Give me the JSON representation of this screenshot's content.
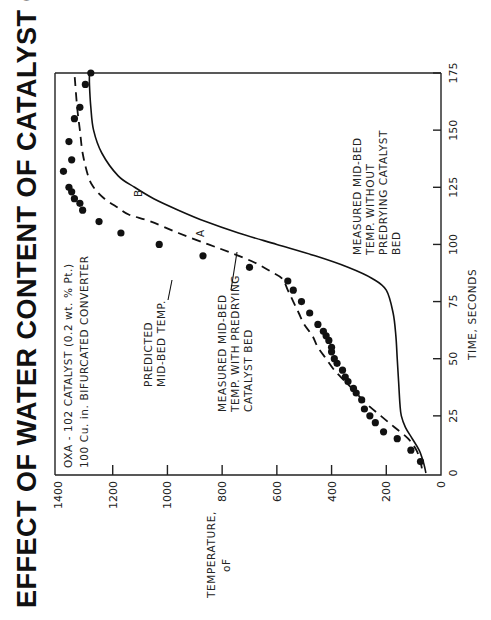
{
  "title": "EFFECT OF WATER CONTENT OF CATALYST ON WARMUP RATE",
  "annotation_box": {
    "line1": "OXA - 102 CATALYST (0.2 wt. % Pt.)",
    "line2": "100 Cu. in. BIFURCATED CONVERTER"
  },
  "labels": {
    "predicted": [
      "PREDICTED",
      "MID-BED TEMP."
    ],
    "measured_with": [
      "MEASURED MID-BED",
      "TEMP. WITH PREDRYING",
      "CATALYST BED"
    ],
    "measured_without": [
      "MEASURED MID-BED",
      "TEMP. WITHOUT",
      "PREDRYING CATALYST",
      "BED"
    ],
    "curve_a": "A",
    "curve_b": "B"
  },
  "axes": {
    "xlabel": "TIME, SECONDS",
    "ylabel_line1": "TEMPERATURE,",
    "ylabel_line2": "oF",
    "x_ticks": [
      "0",
      "25",
      "50",
      "75",
      "100",
      "125",
      "150",
      "175"
    ],
    "y_ticks": [
      "0",
      "200",
      "400",
      "600",
      "800",
      "1000",
      "1200",
      "1400"
    ]
  },
  "chart_data": {
    "type": "line",
    "title": "EFFECT OF WATER CONTENT OF CATALYST ON WARMUP RATE",
    "subtitle": "OXA - 102 CATALYST (0.2 wt. % Pt.) 100 Cu. in. BIFURCATED CONVERTER",
    "xlabel": "TIME, SECONDS",
    "ylabel": "TEMPERATURE, oF",
    "xlim": [
      0,
      175
    ],
    "ylim": [
      0,
      1400
    ],
    "grid": false,
    "legend": "inline annotations",
    "orientation_note": "figure printed rotated 90 degrees counter-clockwise",
    "series": [
      {
        "name": "A - Measured mid-bed temp. with predrying catalyst bed",
        "style": "dashed",
        "x": [
          2,
          5,
          10,
          15,
          20,
          25,
          30,
          35,
          40,
          45,
          50,
          55,
          60,
          65,
          70,
          75,
          80,
          85,
          88,
          92,
          96,
          100,
          105,
          110,
          113,
          116,
          120,
          125,
          130,
          140,
          150,
          160,
          175
        ],
        "y": [
          70,
          75,
          90,
          120,
          170,
          220,
          270,
          310,
          350,
          390,
          420,
          450,
          470,
          500,
          520,
          540,
          560,
          580,
          620,
          680,
          760,
          850,
          960,
          1060,
          1140,
          1180,
          1230,
          1270,
          1290,
          1310,
          1320,
          1330,
          1340
        ]
      },
      {
        "name": "B - Measured mid-bed temp. without predrying catalyst bed",
        "style": "solid",
        "x": [
          0,
          5,
          10,
          15,
          20,
          25,
          30,
          40,
          50,
          60,
          70,
          80,
          85,
          90,
          95,
          100,
          105,
          110,
          115,
          120,
          125,
          130,
          140,
          150,
          160,
          170,
          175
        ],
        "y": [
          55,
          65,
          80,
          105,
          130,
          145,
          150,
          155,
          160,
          165,
          175,
          200,
          250,
          340,
          460,
          600,
          740,
          860,
          960,
          1050,
          1120,
          1180,
          1240,
          1270,
          1280,
          1285,
          1285
        ]
      },
      {
        "name": "Predicted mid-bed temp.",
        "style": "points",
        "x": [
          5,
          10,
          15,
          18,
          22,
          25,
          28,
          32,
          35,
          37,
          40,
          42,
          45,
          48,
          50,
          53,
          55,
          58,
          60,
          62,
          65,
          70,
          75,
          80,
          84,
          90,
          95,
          100,
          105,
          110,
          115,
          118,
          120,
          123,
          125,
          132,
          137,
          145,
          155,
          160,
          170,
          175
        ],
        "y": [
          75,
          110,
          160,
          210,
          240,
          260,
          280,
          290,
          310,
          320,
          340,
          350,
          360,
          380,
          390,
          400,
          400,
          410,
          420,
          430,
          450,
          480,
          510,
          540,
          560,
          700,
          870,
          1030,
          1170,
          1250,
          1310,
          1320,
          1340,
          1350,
          1360,
          1380,
          1350,
          1360,
          1340,
          1320,
          1300,
          1280
        ]
      }
    ]
  }
}
